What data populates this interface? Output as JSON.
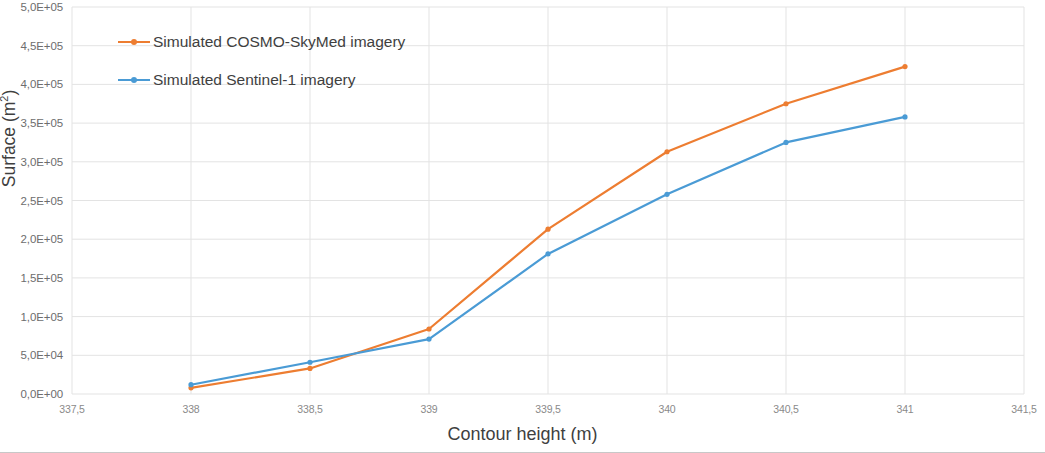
{
  "chart_data": {
    "type": "line",
    "title": "",
    "xlabel": "Contour height (m)",
    "ylabel": "Surface (m²)",
    "xlim": [
      337.5,
      341.5
    ],
    "ylim": [
      0,
      500000
    ],
    "grid": true,
    "legend_position": "top-left-inside",
    "x": [
      338,
      338.5,
      339,
      339.5,
      340,
      340.5,
      341
    ],
    "xtick_labels": [
      "337,5",
      "338",
      "338,5",
      "339",
      "339,5",
      "340",
      "340,5",
      "341",
      "341,5"
    ],
    "xtick_values": [
      337.5,
      338,
      338.5,
      339,
      339.5,
      340,
      340.5,
      341,
      341.5
    ],
    "ytick_labels": [
      "0,0E+00",
      "5,0E+04",
      "1,0E+05",
      "1,5E+05",
      "2,0E+05",
      "2,5E+05",
      "3,0E+05",
      "3,5E+05",
      "4,0E+05",
      "4,5E+05",
      "5,0E+05"
    ],
    "ytick_values": [
      0,
      50000,
      100000,
      150000,
      200000,
      250000,
      300000,
      350000,
      400000,
      450000,
      500000
    ],
    "series": [
      {
        "name": "Simulated COSMO-SkyMed imagery",
        "color": "#ED7D31",
        "values": [
          8000,
          33000,
          84000,
          213000,
          313000,
          375000,
          423000
        ]
      },
      {
        "name": "Simulated Sentinel-1 imagery",
        "color": "#4A9BD5",
        "values": [
          12000,
          41000,
          71000,
          181000,
          258000,
          325000,
          358000
        ]
      }
    ]
  },
  "colors": {
    "grid": "#e3e3e3",
    "tick_text": "#7a7a7a",
    "axis_title": "#3f3f3f",
    "background": "#ffffff"
  },
  "legend": {
    "items": [
      {
        "label": "Simulated COSMO-SkyMed imagery",
        "color": "#ED7D31"
      },
      {
        "label": "Simulated Sentinel-1 imagery",
        "color": "#4A9BD5"
      }
    ]
  }
}
